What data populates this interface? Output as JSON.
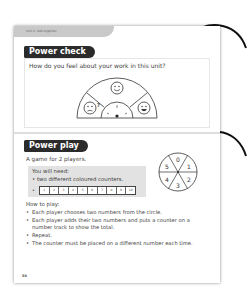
{
  "page": {
    "unit_label": "Unit 2: Add together",
    "page_number": "86"
  },
  "power_check": {
    "title": "Power check",
    "question": "How do you feel about your work in this unit?",
    "faces": [
      {
        "name": "unsure-face",
        "symbol": "?"
      },
      {
        "name": "happy-face"
      },
      {
        "name": "very-happy-face"
      }
    ]
  },
  "power_play": {
    "title": "Power play",
    "intro": "A game for 2 players.",
    "need_title": "You will need:",
    "need_items": [
      "• two different coloured counters."
    ],
    "track_bullet": "•",
    "number_track": [
      "1",
      "2",
      "3",
      "4",
      "5",
      "6",
      "7",
      "8",
      "9",
      "10"
    ],
    "spinner_numbers": [
      "0",
      "1",
      "2",
      "3",
      "4",
      "5"
    ],
    "how_to_title": "How to play:",
    "steps": [
      "Each player chooses two numbers from the circle.",
      "Each player adds their two numbers and puts a counter on a number track to show the total.",
      "Repeat.",
      "The counter must be placed on a different number each time."
    ]
  },
  "colors": {
    "title_bg": "#2b2b2b",
    "tab_bg": "#c9c9c9",
    "need_box_bg": "#e2e2e2"
  }
}
